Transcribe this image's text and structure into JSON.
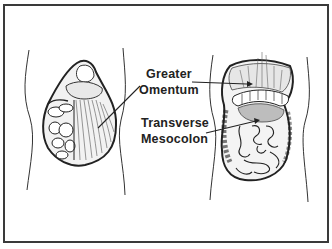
{
  "figure": {
    "type": "anatomical-illustration",
    "panels": [
      {
        "id": "left",
        "description": "Abdomen with greater omentum draped over intestines"
      },
      {
        "id": "right",
        "description": "Abdomen with greater omentum lifted, exposing transverse mesocolon and small intestine"
      }
    ],
    "labels": [
      {
        "id": "greater-omentum",
        "line1": "Greater",
        "line2": "Omentum"
      },
      {
        "id": "transverse-mesocolon",
        "line1": "Transverse",
        "line2": "Mesocolon"
      }
    ],
    "colors": {
      "ink": "#222222",
      "border": "#3a3a3a",
      "shade": "#9a9a9a",
      "background": "#ffffff"
    }
  }
}
